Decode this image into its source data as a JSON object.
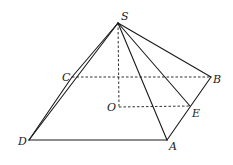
{
  "diagram": {
    "type": "geometry",
    "stroke_color": "#1a1a1a",
    "points": {
      "S": {
        "label": "S",
        "x": 118,
        "y": 23
      },
      "C": {
        "label": "C",
        "x": 72,
        "y": 77
      },
      "B": {
        "label": "B",
        "x": 211,
        "y": 77
      },
      "O": {
        "label": "O",
        "x": 119,
        "y": 107
      },
      "E": {
        "label": "E",
        "x": 190,
        "y": 106
      },
      "D": {
        "label": "D",
        "x": 29,
        "y": 140
      },
      "A": {
        "label": "A",
        "x": 167,
        "y": 140
      }
    },
    "solid_edges": [
      [
        "S",
        "D"
      ],
      [
        "S",
        "C"
      ],
      [
        "S",
        "A"
      ],
      [
        "S",
        "E"
      ],
      [
        "S",
        "B"
      ],
      [
        "D",
        "A"
      ],
      [
        "A",
        "B"
      ],
      [
        "C",
        "D"
      ]
    ],
    "dashed_edges": [
      [
        "C",
        "B"
      ],
      [
        "S",
        "O"
      ],
      [
        "O",
        "E"
      ]
    ]
  }
}
